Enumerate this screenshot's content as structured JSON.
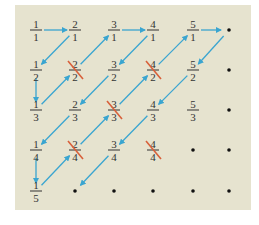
{
  "diagram": {
    "colors": {
      "background": "#e6e3cf",
      "arrow": "#3aa5d0",
      "strike": "#d8603a",
      "text": "#333333",
      "dot": "#111111"
    },
    "columns_x": [
      36,
      75,
      114,
      153,
      193,
      229
    ],
    "rows_y": [
      30,
      70,
      110,
      150,
      191
    ],
    "cells": [
      {
        "num": "1",
        "den": "1",
        "col": 0,
        "row": 0,
        "crossed": false
      },
      {
        "num": "2",
        "den": "1",
        "col": 1,
        "row": 0,
        "crossed": false
      },
      {
        "num": "3",
        "den": "1",
        "col": 2,
        "row": 0,
        "crossed": false
      },
      {
        "num": "4",
        "den": "1",
        "col": 3,
        "row": 0,
        "crossed": false
      },
      {
        "num": "5",
        "den": "1",
        "col": 4,
        "row": 0,
        "crossed": false
      },
      {
        "num": "1",
        "den": "2",
        "col": 0,
        "row": 1,
        "crossed": false
      },
      {
        "num": "2",
        "den": "2",
        "col": 1,
        "row": 1,
        "crossed": true
      },
      {
        "num": "3",
        "den": "2",
        "col": 2,
        "row": 1,
        "crossed": false
      },
      {
        "num": "4",
        "den": "2",
        "col": 3,
        "row": 1,
        "crossed": true
      },
      {
        "num": "5",
        "den": "2",
        "col": 4,
        "row": 1,
        "crossed": false
      },
      {
        "num": "1",
        "den": "3",
        "col": 0,
        "row": 2,
        "crossed": false
      },
      {
        "num": "2",
        "den": "3",
        "col": 1,
        "row": 2,
        "crossed": false
      },
      {
        "num": "3",
        "den": "3",
        "col": 2,
        "row": 2,
        "crossed": true
      },
      {
        "num": "4",
        "den": "3",
        "col": 3,
        "row": 2,
        "crossed": false
      },
      {
        "num": "5",
        "den": "3",
        "col": 4,
        "row": 2,
        "crossed": false
      },
      {
        "num": "1",
        "den": "4",
        "col": 0,
        "row": 3,
        "crossed": false
      },
      {
        "num": "2",
        "den": "4",
        "col": 1,
        "row": 3,
        "crossed": true
      },
      {
        "num": "3",
        "den": "4",
        "col": 2,
        "row": 3,
        "crossed": false
      },
      {
        "num": "4",
        "den": "4",
        "col": 3,
        "row": 3,
        "crossed": true
      },
      {
        "num": "1",
        "den": "5",
        "col": 0,
        "row": 4,
        "crossed": false
      }
    ],
    "dots": [
      [
        5,
        0
      ],
      [
        5,
        1
      ],
      [
        5,
        2
      ],
      [
        4,
        3
      ],
      [
        5,
        3
      ],
      [
        1,
        4
      ],
      [
        2,
        4
      ],
      [
        3,
        4
      ],
      [
        4,
        4
      ],
      [
        5,
        4
      ]
    ],
    "path": [
      [
        0,
        0
      ],
      [
        1,
        0
      ],
      [
        0,
        1
      ],
      [
        0,
        2
      ],
      [
        1,
        1
      ],
      [
        2,
        0
      ],
      [
        3,
        0
      ],
      [
        2,
        1
      ],
      [
        1,
        2
      ],
      [
        0,
        3
      ],
      [
        0,
        4
      ],
      [
        1,
        3
      ],
      [
        2,
        2
      ],
      [
        3,
        1
      ],
      [
        4,
        0
      ],
      [
        5,
        0
      ],
      [
        4,
        1
      ],
      [
        3,
        2
      ],
      [
        2,
        3
      ],
      [
        1,
        4
      ]
    ]
  }
}
